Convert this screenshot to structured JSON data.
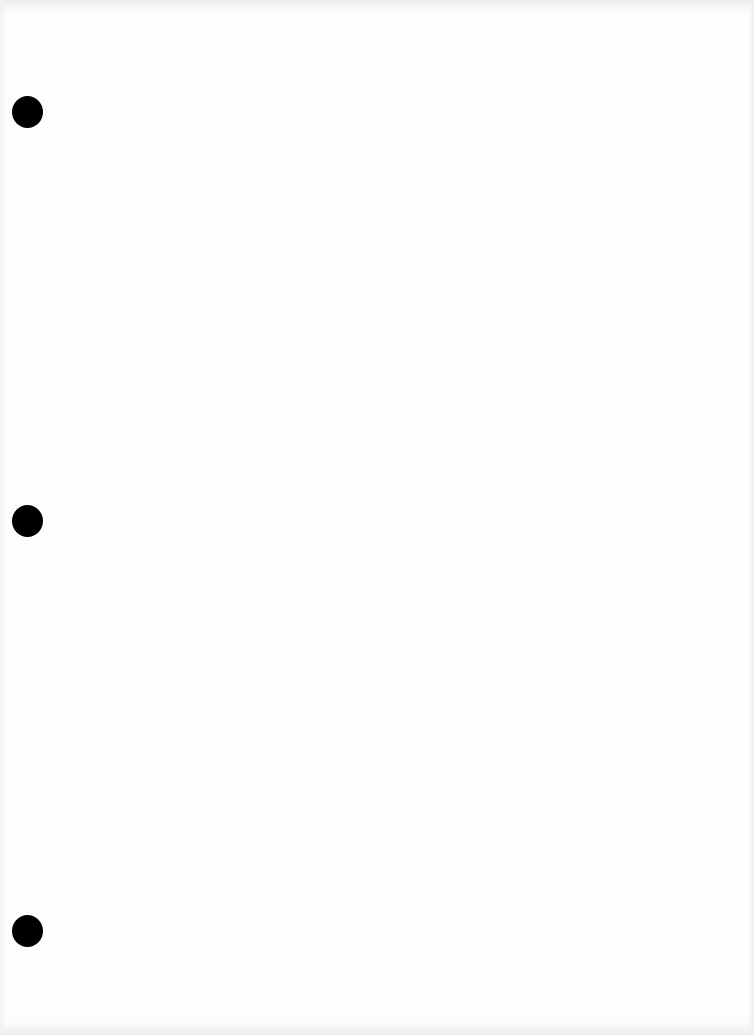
{
  "document": {
    "type": "blank three-hole-punched sheet",
    "background_color": "#fdfdfd",
    "edge_shadow_color": "#ececec",
    "punch_holes": [
      {
        "id": "top",
        "center_x": 27,
        "center_y": 111,
        "diameter": 31,
        "color": "#000000"
      },
      {
        "id": "middle",
        "center_x": 27,
        "center_y": 520,
        "diameter": 31,
        "color": "#000000"
      },
      {
        "id": "bottom",
        "center_x": 27,
        "center_y": 930,
        "diameter": 31,
        "color": "#000000"
      }
    ],
    "text": ""
  }
}
